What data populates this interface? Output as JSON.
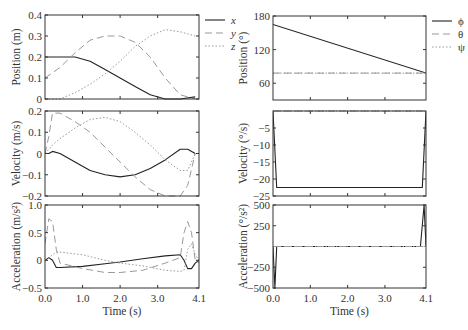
{
  "chart_data": [
    {
      "type": "line",
      "panel": "left-position",
      "title": "",
      "xlabel": "",
      "ylabel": "Position (m)",
      "xlim": [
        0,
        4.1
      ],
      "ylim": [
        0,
        0.4
      ],
      "yticks": [
        0,
        0.1,
        0.2,
        0.3,
        0.4
      ],
      "ytick_labels": [
        "0",
        "0.1",
        "0.2",
        "0.3",
        "0.4"
      ],
      "grid": false,
      "legend_position": "right-outside",
      "x": [
        0,
        0.4,
        0.8,
        1.2,
        1.6,
        2.0,
        2.4,
        2.8,
        3.2,
        3.6,
        4.0
      ],
      "series": [
        {
          "name": "x",
          "style": "solid",
          "color": "#222222",
          "values": [
            0.2,
            0.2,
            0.2,
            0.18,
            0.14,
            0.1,
            0.06,
            0.02,
            0.0,
            0.0,
            0.01
          ]
        },
        {
          "name": "y",
          "style": "dashed",
          "color": "#999999",
          "values": [
            0.1,
            0.15,
            0.22,
            0.28,
            0.3,
            0.3,
            0.27,
            0.2,
            0.1,
            0.02,
            0.0
          ]
        },
        {
          "name": "z",
          "style": "dotted",
          "color": "#999999",
          "values": [
            0.0,
            0.0,
            0.03,
            0.07,
            0.12,
            0.18,
            0.25,
            0.3,
            0.33,
            0.32,
            0.3
          ]
        }
      ]
    },
    {
      "type": "line",
      "panel": "left-velocity",
      "ylabel": "Velocity (m/s)",
      "xlim": [
        0,
        4.1
      ],
      "ylim": [
        -0.2,
        0.2
      ],
      "yticks": [
        -0.2,
        -0.1,
        0,
        0.1,
        0.2
      ],
      "ytick_labels": [
        "−0.2",
        "−0.1",
        "0",
        "0.1",
        "0.2"
      ],
      "x": [
        0,
        0.1,
        0.2,
        0.4,
        0.8,
        1.2,
        1.6,
        2.0,
        2.4,
        2.8,
        3.2,
        3.6,
        3.8,
        4.0
      ],
      "series": [
        {
          "name": "x",
          "style": "solid",
          "color": "#222222",
          "values": [
            0.0,
            0.0,
            0.01,
            0.0,
            -0.04,
            -0.08,
            -0.1,
            -0.11,
            -0.1,
            -0.07,
            -0.03,
            0.02,
            0.02,
            0.0
          ]
        },
        {
          "name": "y",
          "style": "dashed",
          "color": "#999999",
          "values": [
            0.0,
            0.08,
            0.19,
            0.19,
            0.15,
            0.1,
            0.03,
            -0.04,
            -0.11,
            -0.17,
            -0.2,
            -0.2,
            -0.15,
            0.0
          ]
        },
        {
          "name": "z",
          "style": "dotted",
          "color": "#999999",
          "values": [
            0.0,
            0.02,
            0.04,
            0.07,
            0.12,
            0.16,
            0.17,
            0.15,
            0.1,
            0.04,
            -0.03,
            -0.08,
            -0.08,
            0.0
          ]
        }
      ]
    },
    {
      "type": "line",
      "panel": "left-acceleration",
      "xlabel": "Time (s)",
      "ylabel": "Acceleration (m/s²)",
      "xlim": [
        0,
        4.1
      ],
      "ylim": [
        -0.5,
        1.0
      ],
      "xticks": [
        0,
        1,
        2,
        3,
        4.1
      ],
      "xtick_labels": [
        "0.0",
        "1.0",
        "2.0",
        "3.0",
        "4.1"
      ],
      "yticks": [
        -0.5,
        0,
        0.5,
        1.0
      ],
      "ytick_labels": [
        "−0.5",
        "0",
        "0.5",
        "1.0"
      ],
      "x": [
        0,
        0.1,
        0.2,
        0.3,
        0.4,
        1.0,
        1.6,
        2.0,
        2.6,
        3.2,
        3.6,
        3.7,
        3.8,
        3.9,
        4.0,
        4.1
      ],
      "series": [
        {
          "name": "x",
          "style": "solid",
          "color": "#222222",
          "values": [
            0.0,
            0.05,
            0.0,
            -0.13,
            -0.13,
            -0.11,
            -0.06,
            -0.03,
            0.03,
            0.08,
            0.1,
            0.0,
            -0.15,
            -0.15,
            -0.05,
            0.0
          ]
        },
        {
          "name": "y",
          "style": "dashed",
          "color": "#999999",
          "values": [
            0.3,
            0.75,
            0.7,
            0.2,
            -0.05,
            -0.15,
            -0.22,
            -0.22,
            -0.18,
            -0.05,
            0.05,
            0.5,
            0.7,
            0.5,
            0.0,
            -0.05
          ]
        },
        {
          "name": "z",
          "style": "dotted",
          "color": "#999999",
          "values": [
            0.0,
            0.05,
            0.1,
            0.15,
            0.15,
            0.1,
            0.0,
            -0.05,
            -0.1,
            -0.18,
            -0.2,
            -0.18,
            0.2,
            0.3,
            0.1,
            0.0
          ]
        }
      ]
    },
    {
      "type": "line",
      "panel": "right-position",
      "ylabel": "Position (°)",
      "xlim": [
        0,
        4.1
      ],
      "ylim": [
        30,
        180
      ],
      "yticks": [
        60,
        120,
        180
      ],
      "ytick_labels": [
        "60",
        "120",
        "180"
      ],
      "legend_position": "right-outside",
      "x": [
        0,
        4.1
      ],
      "series": [
        {
          "name": "ϕ",
          "style": "solid",
          "color": "#222222",
          "values": [
            165,
            78
          ]
        },
        {
          "name": "θ",
          "style": "dashed",
          "color": "#999999",
          "values": [
            78,
            78
          ]
        },
        {
          "name": "ψ",
          "style": "dotted",
          "color": "#999999",
          "values": [
            78,
            78
          ]
        }
      ]
    },
    {
      "type": "line",
      "panel": "right-velocity",
      "ylabel": "Velocity (°/s)",
      "xlim": [
        0,
        4.1
      ],
      "ylim": [
        -25,
        0
      ],
      "yticks": [
        -25,
        -20,
        -15,
        -10,
        -5
      ],
      "ytick_labels": [
        "−25",
        "−20",
        "−15",
        "−10",
        "−5"
      ],
      "x": [
        0,
        0.1,
        4.0,
        4.1
      ],
      "series": [
        {
          "name": "ϕ",
          "style": "solid",
          "color": "#222222",
          "values": [
            0,
            -22.5,
            -22.5,
            0
          ]
        },
        {
          "name": "θ",
          "style": "dashed",
          "color": "#999999",
          "values": [
            0,
            0,
            0,
            0
          ]
        },
        {
          "name": "ψ",
          "style": "dotted",
          "color": "#999999",
          "values": [
            0,
            0,
            0,
            0
          ]
        }
      ]
    },
    {
      "type": "line",
      "panel": "right-acceleration",
      "xlabel": "Time (s)",
      "ylabel": "Acceleration (°/s²)",
      "xlim": [
        0,
        4.1
      ],
      "ylim": [
        -500,
        500
      ],
      "xticks": [
        0,
        1,
        2,
        3,
        4.1
      ],
      "xtick_labels": [
        "0.0",
        "1.0",
        "2.0",
        "3.0",
        "4.1"
      ],
      "yticks": [
        -500,
        -250,
        250,
        500
      ],
      "ytick_labels": [
        "−500",
        "−250",
        "250",
        "500"
      ],
      "x": [
        0,
        0.05,
        0.1,
        3.95,
        4.05,
        4.1
      ],
      "series": [
        {
          "name": "ϕ",
          "style": "solid",
          "color": "#222222",
          "values": [
            0,
            -500,
            0,
            0,
            500,
            0
          ]
        },
        {
          "name": "θ",
          "style": "dashed",
          "color": "#999999",
          "values": [
            0,
            0,
            0,
            0,
            0,
            0
          ]
        },
        {
          "name": "ψ",
          "style": "dotted",
          "color": "#999999",
          "values": [
            0,
            0,
            0,
            0,
            0,
            0
          ]
        }
      ]
    }
  ],
  "labels": {
    "left_legend": [
      "x",
      "y",
      "z"
    ],
    "right_legend": [
      "ϕ",
      "θ",
      "ψ"
    ],
    "time_label": "Time (s)"
  }
}
